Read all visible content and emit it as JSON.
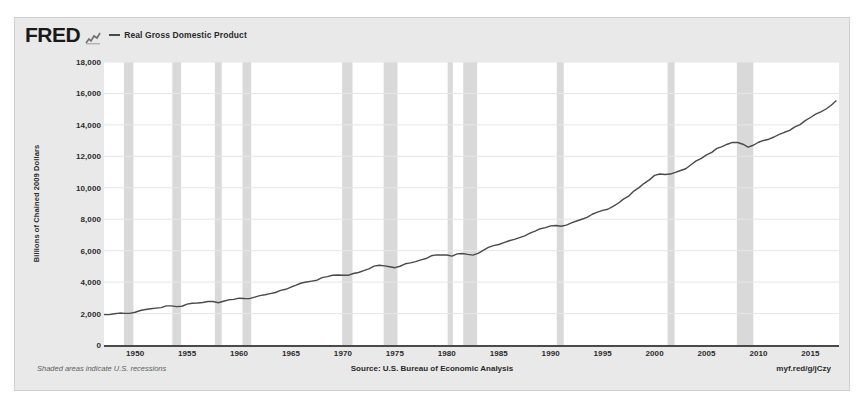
{
  "header": {
    "logo_text": "FRED",
    "logo_glyph": "mini-line-chart-icon",
    "legend_label": "Real Gross Domestic Product",
    "legend_color": "#4a4a4a"
  },
  "footer": {
    "recession_note": "Shaded areas indicate U.S. recessions",
    "source": "Source: U.S. Bureau of Economic Analysis",
    "permalink": "myf.red/g/jCzy"
  },
  "style": {
    "card_background": "#e9e9e9",
    "plot_background": "#ffffff",
    "gridline_color": "#e6e6e6",
    "axis_color": "#4a4a4a",
    "recession_band_color": "#d9d9d9",
    "text_color": "#2b2b2b"
  },
  "chart_data": {
    "type": "line",
    "title": "Real Gross Domestic Product",
    "xlabel": "",
    "ylabel": "Billions of Chained 2009 Dollars",
    "xlim": [
      1947.0,
      2017.75
    ],
    "ylim": [
      0,
      18000
    ],
    "grid": true,
    "legend_position": "top-left",
    "ytick_labels": [
      "18,000",
      "16,000",
      "14,000",
      "12,000",
      "10,000",
      "8,000",
      "6,000",
      "4,000",
      "2,000",
      "0"
    ],
    "yticks": [
      18000,
      16000,
      14000,
      12000,
      10000,
      8000,
      6000,
      4000,
      2000,
      0
    ],
    "xtick_labels": [
      "1950",
      "1955",
      "1960",
      "1965",
      "1970",
      "1975",
      "1980",
      "1985",
      "1990",
      "1995",
      "2000",
      "2005",
      "2010",
      "2015"
    ],
    "xticks": [
      1950,
      1955,
      1960,
      1965,
      1970,
      1975,
      1980,
      1985,
      1990,
      1995,
      2000,
      2005,
      2010,
      2015
    ],
    "series": [
      {
        "name": "Real Gross Domestic Product",
        "color": "#4a4a4a",
        "units": "Billions of Chained 2009 Dollars",
        "x": [
          1947.0,
          1947.5,
          1948.0,
          1948.5,
          1949.0,
          1949.5,
          1950.0,
          1950.5,
          1951.0,
          1951.5,
          1952.0,
          1952.5,
          1953.0,
          1953.5,
          1954.0,
          1954.5,
          1955.0,
          1955.5,
          1956.0,
          1956.5,
          1957.0,
          1957.5,
          1958.0,
          1958.5,
          1959.0,
          1959.5,
          1960.0,
          1960.5,
          1961.0,
          1961.5,
          1962.0,
          1962.5,
          1963.0,
          1963.5,
          1964.0,
          1964.5,
          1965.0,
          1965.5,
          1966.0,
          1966.5,
          1967.0,
          1967.5,
          1968.0,
          1968.5,
          1969.0,
          1969.5,
          1970.0,
          1970.5,
          1971.0,
          1971.5,
          1972.0,
          1972.5,
          1973.0,
          1973.5,
          1974.0,
          1974.5,
          1975.0,
          1975.5,
          1976.0,
          1976.5,
          1977.0,
          1977.5,
          1978.0,
          1978.5,
          1979.0,
          1979.5,
          1980.0,
          1980.5,
          1981.0,
          1981.5,
          1982.0,
          1982.5,
          1983.0,
          1983.5,
          1984.0,
          1984.5,
          1985.0,
          1985.5,
          1986.0,
          1986.5,
          1987.0,
          1987.5,
          1988.0,
          1988.5,
          1989.0,
          1989.5,
          1990.0,
          1990.5,
          1991.0,
          1991.5,
          1992.0,
          1992.5,
          1993.0,
          1993.5,
          1994.0,
          1994.5,
          1995.0,
          1995.5,
          1996.0,
          1996.5,
          1997.0,
          1997.5,
          1998.0,
          1998.5,
          1999.0,
          1999.5,
          2000.0,
          2000.5,
          2001.0,
          2001.5,
          2002.0,
          2002.5,
          2003.0,
          2003.5,
          2004.0,
          2004.5,
          2005.0,
          2005.5,
          2006.0,
          2006.5,
          2007.0,
          2007.5,
          2008.0,
          2008.5,
          2009.0,
          2009.5,
          2010.0,
          2010.5,
          2011.0,
          2011.5,
          2012.0,
          2012.5,
          2013.0,
          2013.5,
          2014.0,
          2014.5,
          2015.0,
          2015.5,
          2016.0,
          2016.5,
          2017.0,
          2017.5
        ],
        "y": [
          1934,
          1934,
          1989,
          2031,
          2010,
          2009,
          2084,
          2194,
          2255,
          2306,
          2346,
          2377,
          2491,
          2487,
          2438,
          2465,
          2601,
          2657,
          2673,
          2705,
          2766,
          2766,
          2690,
          2780,
          2874,
          2901,
          2977,
          2954,
          2948,
          3041,
          3142,
          3200,
          3269,
          3339,
          3474,
          3544,
          3676,
          3804,
          3943,
          4005,
          4062,
          4120,
          4287,
          4346,
          4434,
          4452,
          4437,
          4433,
          4547,
          4610,
          4732,
          4841,
          5013,
          5069,
          5030,
          4977,
          4917,
          5009,
          5167,
          5223,
          5302,
          5411,
          5501,
          5673,
          5734,
          5727,
          5725,
          5652,
          5794,
          5823,
          5762,
          5720,
          5830,
          6017,
          6207,
          6319,
          6391,
          6512,
          6631,
          6715,
          6830,
          6946,
          7113,
          7241,
          7398,
          7465,
          7580,
          7597,
          7551,
          7625,
          7767,
          7885,
          7998,
          8112,
          8316,
          8447,
          8566,
          8634,
          8813,
          9017,
          9281,
          9465,
          9789,
          10008,
          10285,
          10501,
          10790,
          10875,
          10848,
          10872,
          10978,
          11101,
          11211,
          11461,
          11713,
          11868,
          12095,
          12254,
          12503,
          12618,
          12770,
          12890,
          12880,
          12770,
          12590,
          12705,
          12895,
          13010,
          13090,
          13230,
          13400,
          13530,
          13650,
          13870,
          14020,
          14270,
          14470,
          14680,
          14830,
          15010,
          15250,
          15550
        ]
      }
    ],
    "recessions": [
      {
        "start": 1948.92,
        "end": 1949.83
      },
      {
        "start": 1953.58,
        "end": 1954.42
      },
      {
        "start": 1957.67,
        "end": 1958.33
      },
      {
        "start": 1960.33,
        "end": 1961.17
      },
      {
        "start": 1969.92,
        "end": 1970.92
      },
      {
        "start": 1973.92,
        "end": 1975.25
      },
      {
        "start": 1980.08,
        "end": 1980.58
      },
      {
        "start": 1981.58,
        "end": 1982.92
      },
      {
        "start": 1990.58,
        "end": 1991.25
      },
      {
        "start": 2001.25,
        "end": 2001.92
      },
      {
        "start": 2007.92,
        "end": 2009.5
      }
    ]
  }
}
